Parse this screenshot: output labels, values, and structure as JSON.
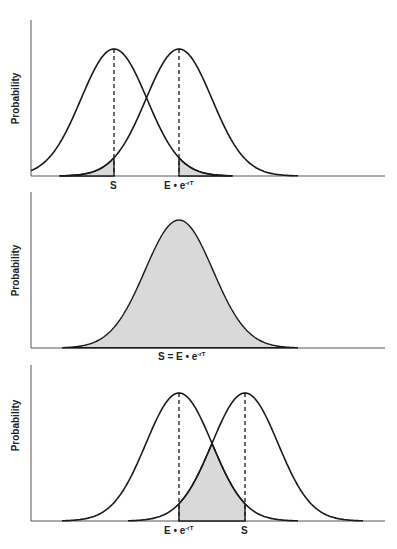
{
  "panels": [
    {
      "id": "top",
      "ylabel": "Probability",
      "x_labels": [
        {
          "text": "S",
          "sup": ""
        },
        {
          "text": "E • e",
          "sup": "-rT"
        }
      ],
      "description": "Two normal curves; S left of E•e^-rT; shaded tails: left tail of right curve up to S, right tail of left curve beyond E•e^-rT",
      "geometry": {
        "axis_top": 20,
        "baseline": 176,
        "axis_left": 31,
        "axis_right": 385,
        "peaks_x": [
          114,
          179
        ],
        "peak_y": 49
      }
    },
    {
      "id": "middle",
      "ylabel": "Probability",
      "x_labels": [
        {
          "text": "S = E • e",
          "sup": "-rT"
        }
      ],
      "description": "Single fully shaded normal curve centered at S = E•e^-rT",
      "geometry": {
        "axis_top": 192,
        "baseline": 348,
        "axis_left": 31,
        "axis_right": 385,
        "peaks_x": [
          179
        ],
        "peak_y": 220
      }
    },
    {
      "id": "bottom",
      "ylabel": "Probability",
      "x_labels": [
        {
          "text": "E • e",
          "sup": "-rT"
        },
        {
          "text": "S",
          "sup": ""
        }
      ],
      "description": "Two normal curves; E•e^-rT left of S; shaded region between E•e^-rT and S under the lower envelope",
      "geometry": {
        "axis_top": 365,
        "baseline": 521,
        "axis_left": 31,
        "axis_right": 385,
        "peaks_x": [
          179,
          245
        ],
        "peak_y": 393
      }
    }
  ],
  "colors": {
    "line": "#1a1a1a",
    "shade": "#d9d9d9",
    "axis": "#555555"
  }
}
